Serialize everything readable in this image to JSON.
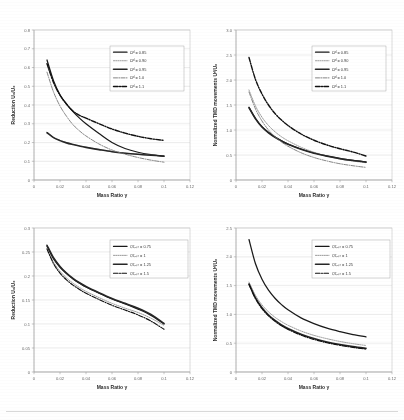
{
  "figure": {
    "title": "",
    "panels": [
      "top-left",
      "top-right",
      "bottom-left",
      "bottom-right"
    ]
  },
  "axis": {
    "x_label": "Mass Ratio",
    "x_symbol": "γ",
    "y_label_reduction": "Reduction U",
    "y_label_tmd": "Normalized TMD movements U"
  },
  "chart_data": [
    {
      "id": "top-left",
      "type": "line",
      "title": "",
      "xlabel": "Mass Ratio γ",
      "ylabel": "Reduction U₀/U₀",
      "xlim": [
        0,
        0.12
      ],
      "ylim": [
        0,
        0.8
      ],
      "xticks": [
        0,
        0.02,
        0.04,
        0.06,
        0.08,
        0.1,
        0.12
      ],
      "xticklabels": [
        "0",
        "0.02",
        "0.04",
        "0.06",
        "0.08",
        "0.1",
        "0.12"
      ],
      "yticks": [
        0,
        0.1,
        0.2,
        0.3,
        0.4,
        0.5,
        0.6,
        0.7,
        0.8
      ],
      "yticklabels": [
        "0",
        "0.1",
        "0.2",
        "0.3",
        "0.4",
        "0.5",
        "0.6",
        "0.7",
        "0.8"
      ],
      "grid": true,
      "legend_position": "upper-right",
      "x": [
        0.01,
        0.015,
        0.02,
        0.025,
        0.03,
        0.035,
        0.04,
        0.05,
        0.06,
        0.07,
        0.08,
        0.09,
        0.1
      ],
      "series": [
        {
          "name": "Ωᵈ = 0.85",
          "style": "solid",
          "width": 1.25,
          "color": "#1a1a1a",
          "values": [
            0.64,
            0.53,
            0.455,
            0.405,
            0.365,
            0.33,
            0.3,
            0.248,
            0.2,
            0.168,
            0.148,
            0.135,
            0.126
          ]
        },
        {
          "name": "Ωᵈ = 0.90",
          "style": "dotted",
          "width": 0.9,
          "color": "#8e8e8e",
          "values": [
            0.255,
            0.228,
            0.212,
            0.2,
            0.19,
            0.182,
            0.175,
            0.163,
            0.152,
            0.144,
            0.138,
            0.133,
            0.129
          ]
        },
        {
          "name": "Ωᵈ = 0.95",
          "style": "solid-thick",
          "width": 1.6,
          "color": "#262626",
          "values": [
            0.252,
            0.226,
            0.21,
            0.198,
            0.189,
            0.181,
            0.174,
            0.162,
            0.151,
            0.143,
            0.137,
            0.132,
            0.128
          ]
        },
        {
          "name": "Ωᵈ = 1.0",
          "style": "dashdot",
          "width": 0.85,
          "color": "#707070",
          "values": [
            0.575,
            0.47,
            0.395,
            0.34,
            0.295,
            0.262,
            0.235,
            0.192,
            0.16,
            0.138,
            0.12,
            0.106,
            0.095
          ]
        },
        {
          "name": "Ωᵈ = 1.1",
          "style": "dashdot-thick",
          "width": 1.4,
          "color": "#111111",
          "values": [
            0.62,
            0.52,
            0.452,
            0.405,
            0.368,
            0.345,
            0.33,
            0.3,
            0.272,
            0.25,
            0.233,
            0.22,
            0.211
          ]
        }
      ]
    },
    {
      "id": "top-right",
      "type": "line",
      "title": "",
      "xlabel": "Mass Ratio γ",
      "ylabel": "Normalized TMD movements Uᵈ/U₀",
      "xlim": [
        0,
        0.12
      ],
      "ylim": [
        0,
        3.0
      ],
      "xticks": [
        0,
        0.02,
        0.04,
        0.06,
        0.08,
        0.1,
        0.12
      ],
      "xticklabels": [
        "0",
        "0.02",
        "0.04",
        "0.06",
        "0.08",
        "0.1",
        "0.12"
      ],
      "yticks": [
        0,
        0.5,
        1.0,
        1.5,
        2.0,
        2.5,
        3.0
      ],
      "yticklabels": [
        "0",
        "0.5",
        "1.0",
        "1.5",
        "2.0",
        "2.5",
        "3.0"
      ],
      "grid": true,
      "legend_position": "upper-right",
      "x": [
        0.01,
        0.015,
        0.02,
        0.025,
        0.03,
        0.035,
        0.04,
        0.05,
        0.06,
        0.07,
        0.08,
        0.09,
        0.1
      ],
      "series": [
        {
          "name": "Ωᵈ = 0.85",
          "style": "solid",
          "width": 1.25,
          "color": "#1a1a1a",
          "values": [
            1.455,
            1.23,
            1.065,
            0.95,
            0.86,
            0.785,
            0.72,
            0.62,
            0.54,
            0.48,
            0.43,
            0.392,
            0.36
          ]
        },
        {
          "name": "Ωᵈ = 0.90",
          "style": "dotted",
          "width": 0.9,
          "color": "#8e8e8e",
          "values": [
            1.8,
            1.48,
            1.255,
            1.09,
            0.965,
            0.865,
            0.785,
            0.655,
            0.555,
            0.48,
            0.42,
            0.378,
            0.345
          ]
        },
        {
          "name": "Ωᵈ = 0.95",
          "style": "solid-thick",
          "width": 1.6,
          "color": "#262626",
          "values": [
            1.445,
            1.225,
            1.06,
            0.945,
            0.855,
            0.78,
            0.715,
            0.615,
            0.536,
            0.477,
            0.428,
            0.39,
            0.358
          ]
        },
        {
          "name": "Ωᵈ = 1.0",
          "style": "dashdot",
          "width": 0.85,
          "color": "#707070",
          "values": [
            1.76,
            1.42,
            1.18,
            1.0,
            0.865,
            0.76,
            0.675,
            0.545,
            0.45,
            0.38,
            0.325,
            0.285,
            0.252
          ]
        },
        {
          "name": "Ωᵈ = 1.1",
          "style": "dashdot-thick",
          "width": 1.4,
          "color": "#111111",
          "values": [
            2.45,
            2.01,
            1.72,
            1.5,
            1.33,
            1.2,
            1.09,
            0.92,
            0.795,
            0.7,
            0.625,
            0.56,
            0.48
          ]
        }
      ]
    },
    {
      "id": "bottom-left",
      "type": "line",
      "title": "",
      "xlabel": "Mass Ratio γ",
      "ylabel": "Reduction U₀/U₀",
      "xlim": [
        0,
        0.12
      ],
      "ylim": [
        0,
        0.3
      ],
      "xticks": [
        0,
        0.02,
        0.04,
        0.06,
        0.08,
        0.1,
        0.12
      ],
      "xticklabels": [
        "0",
        "0.02",
        "0.04",
        "0.06",
        "0.08",
        "0.1",
        "0.12"
      ],
      "yticks": [
        0,
        0.05,
        0.1,
        0.15,
        0.2,
        0.25,
        0.3
      ],
      "yticklabels": [
        "0",
        "0.05",
        "0.1",
        "0.15",
        "0.2",
        "0.25",
        "0.3"
      ],
      "grid": true,
      "legend_position": "upper-right",
      "x": [
        0.01,
        0.015,
        0.02,
        0.025,
        0.03,
        0.035,
        0.04,
        0.05,
        0.06,
        0.07,
        0.08,
        0.09,
        0.1
      ],
      "series": [
        {
          "name": "ζ/ζₒₚₜ = 0.75",
          "style": "solid",
          "width": 1.25,
          "color": "#1a1a1a",
          "values": [
            0.262,
            0.236,
            0.218,
            0.205,
            0.194,
            0.185,
            0.177,
            0.164,
            0.152,
            0.142,
            0.131,
            0.118,
            0.1
          ]
        },
        {
          "name": "ζ/ζₒₚₜ = 1",
          "style": "dotted",
          "width": 0.9,
          "color": "#8e8e8e",
          "values": [
            0.258,
            0.229,
            0.21,
            0.196,
            0.185,
            0.176,
            0.168,
            0.155,
            0.143,
            0.133,
            0.124,
            0.112,
            0.097
          ]
        },
        {
          "name": "ζ/ζₒₚₜ = 1.25",
          "style": "solid-thick",
          "width": 1.6,
          "color": "#262626",
          "values": [
            0.264,
            0.238,
            0.22,
            0.206,
            0.195,
            0.186,
            0.178,
            0.165,
            0.153,
            0.143,
            0.133,
            0.12,
            0.101
          ]
        },
        {
          "name": "ζ/ζₒₚₜ = 1.5",
          "style": "dashdot-thick",
          "width": 1.15,
          "color": "#111111",
          "values": [
            0.256,
            0.226,
            0.206,
            0.192,
            0.181,
            0.172,
            0.164,
            0.151,
            0.139,
            0.129,
            0.119,
            0.106,
            0.089
          ]
        }
      ]
    },
    {
      "id": "bottom-right",
      "type": "line",
      "title": "",
      "xlabel": "Mass Ratio γ",
      "ylabel": "Normalized TMD movements Uᵈ/U₀",
      "xlim": [
        0,
        0.12
      ],
      "ylim": [
        0,
        2.5
      ],
      "xticks": [
        0,
        0.02,
        0.04,
        0.06,
        0.08,
        0.1,
        0.12
      ],
      "xticklabels": [
        "0",
        "0.02",
        "0.04",
        "0.06",
        "0.08",
        "0.1",
        "0.12"
      ],
      "yticks": [
        0,
        0.5,
        1.0,
        1.5,
        2.0,
        2.5
      ],
      "yticklabels": [
        "0",
        "0.5",
        "1.0",
        "1.5",
        "2.0",
        "2.5"
      ],
      "grid": true,
      "legend_position": "upper-right",
      "x": [
        0.01,
        0.015,
        0.02,
        0.025,
        0.03,
        0.035,
        0.04,
        0.05,
        0.06,
        0.07,
        0.08,
        0.09,
        0.1
      ],
      "series": [
        {
          "name": "ζ/ζₒₚₜ = 0.75",
          "style": "solid",
          "width": 1.25,
          "color": "#1a1a1a",
          "values": [
            2.3,
            1.88,
            1.61,
            1.42,
            1.28,
            1.17,
            1.08,
            0.94,
            0.84,
            0.76,
            0.7,
            0.65,
            0.61
          ]
        },
        {
          "name": "ζ/ζₒₚₜ = 1",
          "style": "dotted",
          "width": 0.9,
          "color": "#8e8e8e",
          "values": [
            1.56,
            1.33,
            1.165,
            1.045,
            0.95,
            0.875,
            0.812,
            0.712,
            0.636,
            0.578,
            0.53,
            0.492,
            0.46
          ]
        },
        {
          "name": "ζ/ζₒₚₜ = 1.25",
          "style": "solid-thick",
          "width": 1.6,
          "color": "#262626",
          "values": [
            1.53,
            1.285,
            1.115,
            0.99,
            0.895,
            0.818,
            0.755,
            0.655,
            0.58,
            0.522,
            0.477,
            0.44,
            0.41
          ]
        },
        {
          "name": "ζ/ζₒₚₜ = 1.5",
          "style": "dashdot-thick",
          "width": 1.15,
          "color": "#111111",
          "values": [
            1.52,
            1.272,
            1.1,
            0.975,
            0.88,
            0.802,
            0.74,
            0.64,
            0.565,
            0.508,
            0.463,
            0.427,
            0.398
          ]
        }
      ]
    }
  ]
}
